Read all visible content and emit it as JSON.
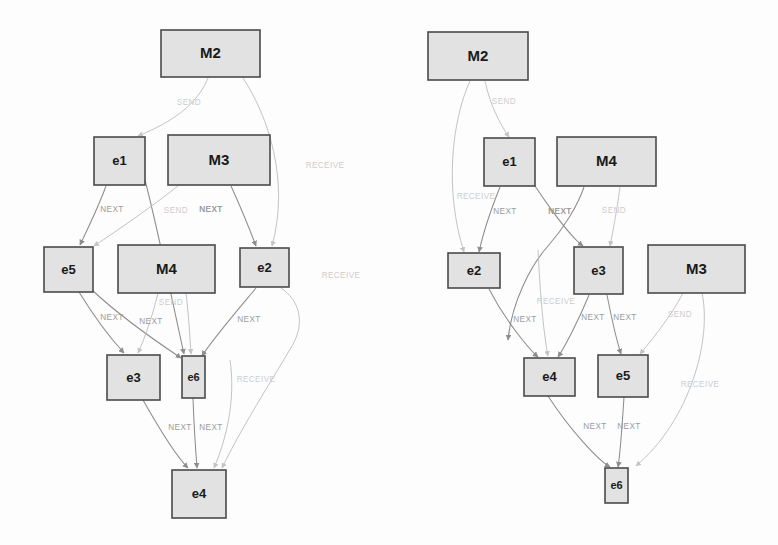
{
  "figure": {
    "background_color": "#fdfdfd",
    "node_fill": "#e2e2e2",
    "node_stroke": "#4a4a4a",
    "edge_color": "#8d8d8d",
    "edge_faint_color": "#c3c3c3",
    "label_color": "#9b9b9b",
    "width": 778,
    "height": 545
  },
  "diagrams": [
    {
      "id": "left-graph",
      "name": "left-event-graph",
      "nodes": [
        {
          "id": "L-M2",
          "label": "M2",
          "kind": "message",
          "x": 161,
          "y": 30,
          "w": 99,
          "h": 47
        },
        {
          "id": "L-e1",
          "label": "e1",
          "kind": "event",
          "x": 94,
          "y": 137,
          "w": 51,
          "h": 48
        },
        {
          "id": "L-M3",
          "label": "M3",
          "kind": "message",
          "x": 168,
          "y": 135,
          "w": 102,
          "h": 50
        },
        {
          "id": "L-e5",
          "label": "e5",
          "kind": "event",
          "x": 44,
          "y": 247,
          "w": 49,
          "h": 45
        },
        {
          "id": "L-M4",
          "label": "M4",
          "kind": "message",
          "x": 118,
          "y": 245,
          "w": 97,
          "h": 48
        },
        {
          "id": "L-e2",
          "label": "e2",
          "kind": "event",
          "x": 240,
          "y": 248,
          "w": 49,
          "h": 39
        },
        {
          "id": "L-e3",
          "label": "e3",
          "kind": "event",
          "x": 107,
          "y": 355,
          "w": 53,
          "h": 45
        },
        {
          "id": "L-e6",
          "label": "e6",
          "kind": "event-small",
          "x": 182,
          "y": 356,
          "w": 23,
          "h": 42
        },
        {
          "id": "L-e4",
          "label": "e4",
          "kind": "event",
          "x": 172,
          "y": 470,
          "w": 54,
          "h": 48
        }
      ],
      "edges": [
        {
          "from": "L-M2",
          "to": "L-e1",
          "label": "SEND",
          "style": "faint",
          "d": "M 208 78 C 197 105 172 122 138 136",
          "lx": 189,
          "ly": 103
        },
        {
          "from": "L-M2",
          "to": "L-e2",
          "label": "RECEIVE",
          "style": "faint",
          "d": "M 243 78 C 268 116 290 180 272 246",
          "lx": 325,
          "ly": 166
        },
        {
          "from": "L-e1",
          "to": "L-e5",
          "label": "NEXT",
          "style": "solid",
          "d": "M 106 186 C 98 208 88 228 80 245",
          "lx": 112,
          "ly": 210
        },
        {
          "from": "L-e1",
          "to": "L-e6",
          "label": "NEXT",
          "style": "solid",
          "d": "M 145 180 C 158 230 172 300 184 354",
          "lx": 211,
          "ly": 210
        },
        {
          "from": "L-M3",
          "to": "L-e2",
          "label": "NEXT",
          "style": "solid",
          "d": "M 231 186 C 241 208 250 230 256 246",
          "lx": 211,
          "ly": 210
        },
        {
          "from": "L-M3",
          "to": "L-e5",
          "label": "SEND",
          "style": "faint",
          "d": "M 178 186 C 150 208 118 230 94 246",
          "lx": 176,
          "ly": 211
        },
        {
          "from": "L-e5",
          "to": "L-e3",
          "label": "NEXT",
          "style": "solid",
          "d": "M 79 292 C 95 318 112 340 124 353",
          "lx": 112,
          "ly": 318
        },
        {
          "from": "L-e5",
          "to": "L-e6",
          "label": "NEXT",
          "style": "solid",
          "d": "M 92 290 C 122 318 160 344 181 358",
          "lx": 151,
          "ly": 322
        },
        {
          "from": "L-M4",
          "to": "L-e3",
          "label": "SEND",
          "style": "faint",
          "d": "M 158 293 C 152 318 144 340 138 353",
          "lx": 171,
          "ly": 303
        },
        {
          "from": "L-M4",
          "to": "L-e6",
          "label": "",
          "style": "faint",
          "d": "M 186 293 C 189 318 190 340 191 354"
        },
        {
          "from": "L-e2",
          "to": "L-e6",
          "label": "NEXT",
          "style": "solid",
          "d": "M 256 288 C 236 312 212 340 202 356",
          "lx": 249,
          "ly": 320
        },
        {
          "from": "L-e2",
          "to": "L-e4",
          "label": "RECEIVE",
          "style": "faint",
          "d": "M 281 288 C 299 300 306 322 292 346 C 272 380 240 430 222 468",
          "lx": 341,
          "ly": 276
        },
        {
          "from": "L-e3",
          "to": "L-e4",
          "label": "NEXT",
          "style": "solid",
          "d": "M 143 400 C 160 430 178 458 188 468",
          "lx": 180,
          "ly": 428
        },
        {
          "from": "L-e6",
          "to": "L-e4",
          "label": "NEXT",
          "style": "solid",
          "d": "M 193 398 C 194 428 196 455 197 468",
          "lx": 211,
          "ly": 428
        },
        {
          "from": "L-e6-recv",
          "to": "L-e4",
          "label": "RECEIVE",
          "style": "faint",
          "d": "M 230 360 C 236 400 226 440 214 468",
          "lx": 256,
          "ly": 380
        }
      ]
    },
    {
      "id": "right-graph",
      "name": "right-event-graph",
      "nodes": [
        {
          "id": "R-M2",
          "label": "M2",
          "kind": "message",
          "x": 428,
          "y": 32,
          "w": 100,
          "h": 48
        },
        {
          "id": "R-e1",
          "label": "e1",
          "kind": "event",
          "x": 484,
          "y": 138,
          "w": 51,
          "h": 48
        },
        {
          "id": "R-M4",
          "label": "M4",
          "kind": "message",
          "x": 557,
          "y": 137,
          "w": 99,
          "h": 49
        },
        {
          "id": "R-e2",
          "label": "e2",
          "kind": "event",
          "x": 448,
          "y": 253,
          "w": 52,
          "h": 35
        },
        {
          "id": "R-e3",
          "label": "e3",
          "kind": "event",
          "x": 574,
          "y": 247,
          "w": 49,
          "h": 47
        },
        {
          "id": "R-M3",
          "label": "M3",
          "kind": "message",
          "x": 648,
          "y": 245,
          "w": 97,
          "h": 48
        },
        {
          "id": "R-e4",
          "label": "e4",
          "kind": "event",
          "x": 524,
          "y": 358,
          "w": 51,
          "h": 38
        },
        {
          "id": "R-e5",
          "label": "e5",
          "kind": "event",
          "x": 598,
          "y": 355,
          "w": 50,
          "h": 42
        },
        {
          "id": "R-e6",
          "label": "e6",
          "kind": "event-small",
          "x": 605,
          "y": 468,
          "w": 23,
          "h": 35
        }
      ],
      "edges": [
        {
          "from": "R-M2",
          "to": "R-e1",
          "label": "SEND",
          "style": "faint",
          "d": "M 485 81 C 490 105 500 124 509 137",
          "lx": 504,
          "ly": 102
        },
        {
          "from": "R-M2",
          "to": "R-e2",
          "label": "RECEIVE",
          "style": "faint",
          "d": "M 470 81 C 452 120 444 190 464 252",
          "lx": 476,
          "ly": 197
        },
        {
          "from": "R-e1",
          "to": "R-e2",
          "label": "NEXT",
          "style": "solid",
          "d": "M 500 187 C 490 212 482 238 479 252",
          "lx": 505,
          "ly": 212
        },
        {
          "from": "R-e1",
          "to": "R-e3",
          "label": "NEXT",
          "style": "solid",
          "d": "M 535 186 C 551 210 572 238 583 246",
          "lx": 560,
          "ly": 212
        },
        {
          "from": "R-M4",
          "to": "R-e3",
          "label": "NEXT",
          "style": "solid",
          "d": "M 584 187 C 578 205 564 228 548 246 C 532 264 512 300 508 340",
          "lx": 560,
          "ly": 212
        },
        {
          "from": "R-M4",
          "to": "R-e3b",
          "label": "SEND",
          "style": "faint",
          "d": "M 620 187 C 617 210 612 236 610 246",
          "lx": 614,
          "ly": 211
        },
        {
          "from": "R-e2",
          "to": "R-e4",
          "label": "NEXT",
          "style": "solid",
          "d": "M 489 289 C 505 320 528 348 538 357",
          "lx": 525,
          "ly": 320
        },
        {
          "from": "R-e2-recv",
          "to": "R-e4",
          "label": "RECEIVE",
          "style": "faint",
          "d": "M 538 250 C 540 290 543 330 548 356",
          "lx": 556,
          "ly": 302
        },
        {
          "from": "R-e3",
          "to": "R-e4",
          "label": "NEXT",
          "style": "solid",
          "d": "M 589 295 C 578 322 564 348 558 357",
          "lx": 593,
          "ly": 318
        },
        {
          "from": "R-e3",
          "to": "R-e5",
          "label": "NEXT",
          "style": "solid",
          "d": "M 607 295 C 612 320 618 345 621 354",
          "lx": 625,
          "ly": 318
        },
        {
          "from": "R-M3",
          "to": "R-e5",
          "label": "SEND",
          "style": "faint",
          "d": "M 683 293 C 670 318 650 342 640 354",
          "lx": 680,
          "ly": 315
        },
        {
          "from": "R-e4",
          "to": "R-e6",
          "label": "NEXT",
          "style": "solid",
          "d": "M 548 396 C 570 430 598 460 610 467",
          "lx": 595,
          "ly": 427
        },
        {
          "from": "R-e5",
          "to": "R-e6",
          "label": "NEXT",
          "style": "solid",
          "d": "M 624 397 C 622 428 620 456 618 467",
          "lx": 629,
          "ly": 427
        },
        {
          "from": "R-M3",
          "to": "R-e6",
          "label": "RECEIVE",
          "style": "faint",
          "d": "M 702 293 C 712 340 690 420 636 466",
          "lx": 700,
          "ly": 385
        }
      ]
    }
  ]
}
